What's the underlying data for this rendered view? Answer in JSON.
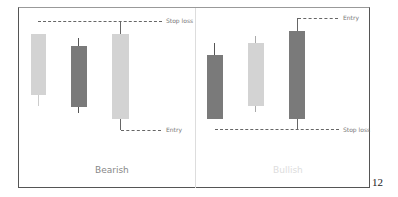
{
  "panels": [
    {
      "title": "Bearish",
      "stop_label": "Stop loss",
      "entry_label": "Entry"
    },
    {
      "title": "Bullish",
      "stop_label": "Stop loss",
      "entry_label": "Entry"
    }
  ],
  "page_number": "12",
  "colors": {
    "light": "#d3d3d3",
    "dark": "#7a7a7a",
    "dash": "#666666",
    "title_bearish": "#888888",
    "title_bullish": "#dddddd"
  }
}
